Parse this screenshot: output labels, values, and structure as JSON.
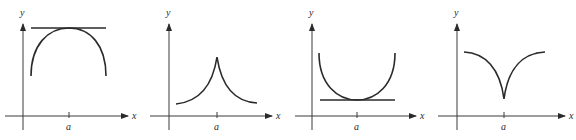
{
  "figure": {
    "axis_labels": {
      "x": "x",
      "y": "y"
    },
    "tick_label": "a",
    "panels": [
      {
        "id": "panel-1",
        "kind": "smooth local maximum with horizontal tangent",
        "has_tangent": true
      },
      {
        "id": "panel-2",
        "kind": "cusp local maximum",
        "has_tangent": false
      },
      {
        "id": "panel-3",
        "kind": "smooth local minimum with horizontal tangent",
        "has_tangent": true
      },
      {
        "id": "panel-4",
        "kind": "cusp local minimum",
        "has_tangent": false
      }
    ]
  },
  "colors": {
    "ink": "#2a2a2a",
    "axis": "#3a3a3a",
    "background": "#ffffff"
  }
}
